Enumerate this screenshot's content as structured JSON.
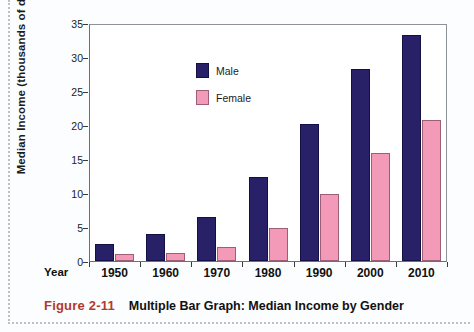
{
  "caption": {
    "figure_number": "Figure 2-11",
    "title": "Multiple Bar Graph: Median Income by Gender"
  },
  "chart_data": {
    "type": "bar",
    "title": "Multiple Bar Graph: Median Income by Gender",
    "xlabel": "Year",
    "ylabel": "Median Income (thousands of dollars)",
    "categories": [
      "1950",
      "1960",
      "1970",
      "1980",
      "1990",
      "2000",
      "2010"
    ],
    "series": [
      {
        "name": "Male",
        "color": "#282168",
        "values": [
          2.5,
          4.0,
          6.5,
          12.4,
          20.2,
          28.2,
          33.3
        ]
      },
      {
        "name": "Female",
        "color": "#f29ab8",
        "values": [
          1.0,
          1.2,
          2.1,
          4.8,
          9.9,
          15.9,
          20.8
        ]
      }
    ],
    "ylim": [
      0,
      35
    ],
    "yticks": [
      0,
      5,
      10,
      15,
      20,
      25,
      30,
      35
    ],
    "ytick_labels": [
      "0",
      "5",
      "10",
      "15",
      "20",
      "25",
      "30",
      "35"
    ],
    "grid": false,
    "legend_position": "top-left"
  }
}
